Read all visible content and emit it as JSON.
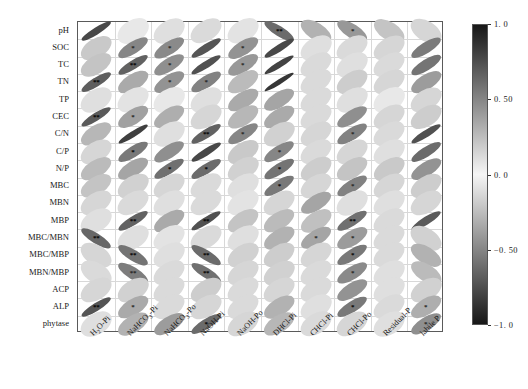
{
  "chart_data": {
    "type": "heatmap",
    "title": "",
    "xlabel": "",
    "ylabel": "",
    "plot_style": "correlation-ellipse-matrix",
    "grid": true,
    "legend_position": "right",
    "colormap": "grayscale-diverging",
    "colorbar": {
      "min": -1.0,
      "max": 1.0,
      "ticks": [
        1.0,
        0.5,
        0.0,
        -0.5,
        -1.0
      ],
      "tick_labels": [
        "1. 0",
        "0. 50",
        "0. 0",
        "−0. 50",
        "−1. 0"
      ]
    },
    "significance_symbols": {
      "p05": "*",
      "p01": "**"
    },
    "rows": [
      "pH",
      "SOC",
      "TC",
      "TN",
      "TP",
      "CEC",
      "C/N",
      "C/P",
      "N/P",
      "MBC",
      "MBN",
      "MBP",
      "MBC/MBN",
      "MBC/MBP",
      "MBN/MBP",
      "ACP",
      "ALP",
      "phytase"
    ],
    "columns": [
      "H₂O-Pi",
      "NaHCO₃-Pi",
      "NaHCO₃-Po",
      "NaOH-Pi",
      "NaOH-Po",
      "DHCl-Pi",
      "CHCl-Pi",
      "CHCl-Po",
      "Residual-P",
      "labile P"
    ],
    "columns_html": [
      "H<sub>2</sub>O-Pi",
      "NaHCO<sub>3</sub>-Pi",
      "NaHCO<sub>3</sub>-Po",
      "NaOH-Pi",
      "NaOH-Po",
      "DHCl-Pi",
      "CHCl-Pi",
      "CHCl-Po",
      "Residual-P",
      "labile P"
    ],
    "values": [
      [
        0.78,
        0.06,
        0.1,
        0.12,
        0.08,
        -0.62,
        -0.3,
        -0.42,
        -0.22,
        -0.14
      ],
      [
        0.2,
        0.5,
        0.48,
        0.72,
        0.44,
        0.78,
        0.1,
        0.12,
        0.14,
        0.55
      ],
      [
        0.22,
        0.66,
        0.46,
        0.74,
        0.42,
        0.8,
        0.12,
        0.1,
        0.12,
        0.58
      ],
      [
        0.68,
        0.34,
        0.44,
        0.52,
        0.26,
        0.86,
        0.12,
        0.18,
        0.14,
        0.4
      ],
      [
        0.1,
        0.08,
        0.06,
        0.1,
        0.34,
        0.36,
        0.12,
        0.1,
        0.06,
        0.14
      ],
      [
        0.7,
        0.38,
        0.32,
        0.14,
        0.28,
        0.34,
        0.12,
        0.46,
        0.14,
        0.18
      ],
      [
        0.28,
        0.82,
        0.1,
        0.66,
        0.5,
        0.16,
        0.14,
        0.52,
        0.12,
        0.74
      ],
      [
        0.14,
        0.56,
        0.46,
        0.78,
        0.2,
        0.5,
        0.12,
        0.14,
        0.1,
        0.62
      ],
      [
        0.26,
        0.36,
        0.6,
        0.62,
        0.16,
        0.58,
        0.18,
        0.22,
        0.2,
        0.44
      ],
      [
        0.22,
        0.16,
        0.14,
        0.12,
        0.1,
        0.56,
        0.14,
        0.52,
        0.14,
        0.18
      ],
      [
        0.14,
        0.12,
        0.1,
        0.12,
        0.08,
        0.14,
        0.36,
        0.1,
        0.1,
        0.14
      ],
      [
        0.1,
        0.66,
        0.34,
        0.74,
        0.22,
        0.26,
        0.24,
        0.6,
        0.12,
        0.7
      ],
      [
        -0.64,
        0.1,
        0.08,
        0.12,
        0.1,
        0.3,
        0.36,
        0.4,
        0.12,
        -0.16
      ],
      [
        -0.14,
        -0.58,
        0.1,
        -0.62,
        0.16,
        0.18,
        0.14,
        0.56,
        0.12,
        -0.3
      ],
      [
        -0.12,
        -0.54,
        0.12,
        -0.6,
        0.14,
        0.16,
        0.12,
        0.48,
        0.1,
        -0.26
      ],
      [
        0.14,
        0.16,
        0.12,
        0.18,
        0.12,
        0.14,
        0.12,
        0.44,
        0.1,
        0.16
      ],
      [
        0.72,
        0.34,
        0.12,
        0.14,
        0.12,
        0.3,
        0.1,
        0.56,
        0.12,
        0.32
      ],
      [
        0.1,
        0.3,
        0.4,
        0.62,
        0.14,
        0.28,
        0.12,
        0.14,
        0.1,
        0.46
      ]
    ],
    "significance": [
      [
        "",
        "",
        "",
        "",
        "",
        "**",
        "",
        "*",
        "",
        ""
      ],
      [
        "",
        "*",
        "*",
        "",
        "*",
        "",
        "",
        "",
        "",
        ""
      ],
      [
        "",
        "**",
        "*",
        "",
        "*",
        "",
        "",
        "",
        "",
        ""
      ],
      [
        "**",
        "",
        "*",
        "*",
        "",
        "",
        "",
        "",
        "",
        ""
      ],
      [
        "",
        "",
        "",
        "",
        "",
        "",
        "",
        "",
        "",
        ""
      ],
      [
        "**",
        "*",
        "",
        "",
        "",
        "",
        "",
        "",
        "",
        ""
      ],
      [
        "",
        "",
        "",
        "**",
        "*",
        "",
        "",
        "*",
        "",
        ""
      ],
      [
        "",
        "*",
        "",
        "",
        "",
        "*",
        "",
        "",
        "",
        ""
      ],
      [
        "",
        "",
        "*",
        "*",
        "",
        "*",
        "",
        "",
        "",
        ""
      ],
      [
        "",
        "",
        "",
        "",
        "",
        "*",
        "",
        "*",
        "",
        ""
      ],
      [
        "",
        "",
        "",
        "",
        "",
        "",
        "",
        "",
        "",
        ""
      ],
      [
        "",
        "**",
        "",
        "**",
        "",
        "",
        "",
        "**",
        "",
        ""
      ],
      [
        "**",
        "",
        "",
        "",
        "",
        "",
        "*",
        "*",
        "",
        ""
      ],
      [
        "",
        "**",
        "",
        "**",
        "",
        "",
        "",
        "*",
        "",
        ""
      ],
      [
        "",
        "**",
        "",
        "**",
        "",
        "",
        "",
        "*",
        "",
        ""
      ],
      [
        "",
        "",
        "",
        "",
        "",
        "",
        "",
        "",
        "",
        ""
      ],
      [
        "**",
        "*",
        "",
        "",
        "",
        "",
        "",
        "*",
        "",
        "*"
      ],
      [
        "",
        "",
        "",
        "*",
        "",
        "",
        "",
        "",
        "",
        "*"
      ]
    ]
  }
}
